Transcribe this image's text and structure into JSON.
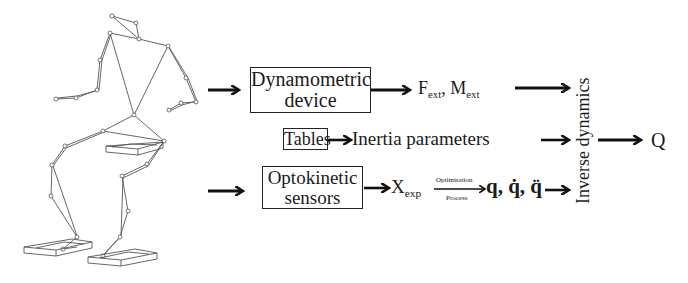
{
  "diagram": {
    "figure": "stick-figure skeleton with force plates",
    "inputs": {
      "top_row": {
        "box_label_line1": "Dynamometric",
        "box_label_line2": "device",
        "output_F": "F",
        "output_F_sub": "ext",
        "separator": ",",
        "output_M": "M",
        "output_M_sub": "ext"
      },
      "middle_row": {
        "box_label": "Tables",
        "output": "Inertia parameters"
      },
      "bottom_row": {
        "box_label_line1": "Optokinetic",
        "box_label_line2": "sensors",
        "output_X": "X",
        "output_X_sub": "exp",
        "arrow_top_label": "Optimisation",
        "arrow_bottom_label": "Process",
        "result": "q, q̇, q̈"
      }
    },
    "process_label": "Inverse dynamics",
    "final_output": "Q",
    "colors": {
      "ink": "#1a1a1a",
      "background": "#ffffff"
    }
  }
}
